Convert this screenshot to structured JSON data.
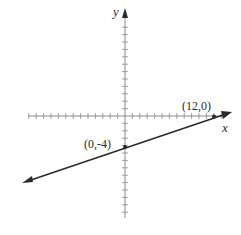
{
  "chart_data": {
    "type": "line",
    "title": "",
    "xlabel": "x",
    "ylabel": "y",
    "xlim": [
      -13,
      14
    ],
    "ylim": [
      -14,
      14
    ],
    "grid": false,
    "axis_ticks": "unit tick marks on both axes",
    "series": [
      {
        "name": "line through (0,-4) and (12,0)",
        "equation": "y = (1/3)x - 4",
        "x": [
          -13.5,
          0,
          12,
          13
        ],
        "y": [
          -8.5,
          -4,
          0,
          0.33
        ],
        "arrows_both_ends": true
      }
    ],
    "points": [
      {
        "x": 0,
        "y": -4,
        "label": "(0,-4)"
      },
      {
        "x": 12,
        "y": 0,
        "label": "(12,0)"
      }
    ],
    "annotations": [
      "(0,-4)",
      "(12,0)"
    ]
  },
  "labels": {
    "x_axis": "x",
    "y_axis": "y",
    "point_a": "(0,-4)",
    "point_b": "(12,0)"
  },
  "colors": {
    "axis": "#8a8a8a",
    "line": "#2a2a2a",
    "text": "#2a2a2a"
  }
}
